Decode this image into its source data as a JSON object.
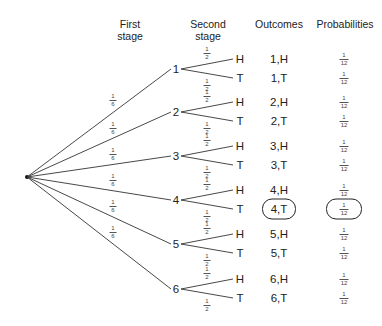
{
  "headers": {
    "first_stage": "First\nstage",
    "second_stage": "Second\nstage",
    "outcomes": "Outcomes",
    "probabilities": "Probabilities"
  },
  "root": {
    "x": 27,
    "y": 177
  },
  "first_stage_probability": {
    "num": "1",
    "den": "6"
  },
  "second_stage_probability": {
    "num": "1",
    "den": "2"
  },
  "nodes": [
    {
      "label": "1",
      "y": 69
    },
    {
      "label": "2",
      "y": 112
    },
    {
      "label": "3",
      "y": 156
    },
    {
      "label": "4",
      "y": 200
    },
    {
      "label": "5",
      "y": 244
    },
    {
      "label": "6",
      "y": 289
    }
  ],
  "branches": [
    "H",
    "T"
  ],
  "outcomes": [
    {
      "outcome": "1,H",
      "probability": {
        "num": "1",
        "den": "12"
      },
      "highlighted": false
    },
    {
      "outcome": "1,T",
      "probability": {
        "num": "1",
        "den": "12"
      },
      "highlighted": false
    },
    {
      "outcome": "2,H",
      "probability": {
        "num": "1",
        "den": "12"
      },
      "highlighted": false
    },
    {
      "outcome": "2,T",
      "probability": {
        "num": "1",
        "den": "12"
      },
      "highlighted": false
    },
    {
      "outcome": "3,H",
      "probability": {
        "num": "1",
        "den": "12"
      },
      "highlighted": false
    },
    {
      "outcome": "3,T",
      "probability": {
        "num": "1",
        "den": "12"
      },
      "highlighted": false
    },
    {
      "outcome": "4,H",
      "probability": {
        "num": "1",
        "den": "12"
      },
      "highlighted": false
    },
    {
      "outcome": "4,T",
      "probability": {
        "num": "1",
        "den": "12"
      },
      "highlighted": true
    },
    {
      "outcome": "5,H",
      "probability": {
        "num": "1",
        "den": "12"
      },
      "highlighted": false
    },
    {
      "outcome": "5,T",
      "probability": {
        "num": "1",
        "den": "12"
      },
      "highlighted": false
    },
    {
      "outcome": "6,H",
      "probability": {
        "num": "1",
        "den": "12"
      },
      "highlighted": false
    },
    {
      "outcome": "6,T",
      "probability": {
        "num": "1",
        "den": "12"
      },
      "highlighted": false
    }
  ]
}
